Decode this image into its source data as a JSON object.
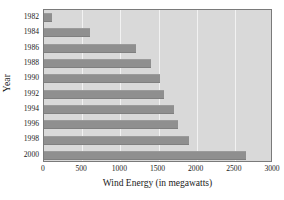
{
  "chart_data": {
    "type": "bar",
    "orientation": "horizontal",
    "title": "",
    "xlabel": "Wind Energy (in megawatts)",
    "ylabel": "Year",
    "categories": [
      "1982",
      "1984",
      "1986",
      "1988",
      "1990",
      "1992",
      "1994",
      "1996",
      "1998",
      "2000"
    ],
    "values": [
      100,
      600,
      1210,
      1400,
      1520,
      1570,
      1700,
      1750,
      1900,
      2650
    ],
    "xlim": [
      0,
      3000
    ],
    "xticks": [
      0,
      500,
      1000,
      1500,
      2000,
      2500,
      3000
    ],
    "xtick_labels": [
      "0",
      "500",
      "1000",
      "1500",
      "2000",
      "2500",
      "3000"
    ],
    "grid": true,
    "grid_axis": "x",
    "legend": false,
    "series": [
      {
        "name": "Wind Energy",
        "values": [
          100,
          600,
          1210,
          1400,
          1520,
          1570,
          1700,
          1750,
          1900,
          2650
        ]
      }
    ]
  },
  "colors": {
    "bar": "#8f8f8f",
    "plot_background": "#d9d9d9",
    "gridline": "#f2f2f2",
    "axis_border": "#7a7a7a",
    "page_background": "#ffffff",
    "text": "#1a1a1a"
  }
}
